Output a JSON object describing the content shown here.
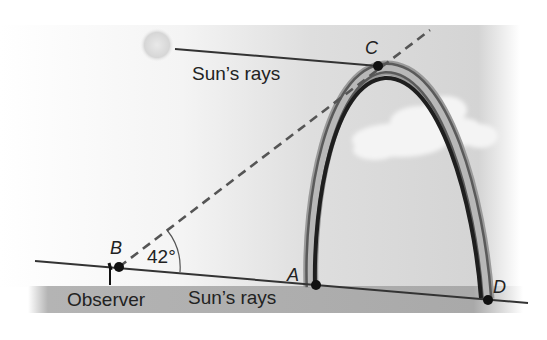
{
  "diagram": {
    "type": "rainbow-geometry",
    "labels": {
      "top_ray": "Sun’s rays",
      "bottom_ray": "Sun’s rays",
      "observer": "Observer",
      "angle": "42°"
    },
    "points": {
      "A": "A",
      "B": "B",
      "C": "C",
      "D": "D"
    },
    "colors": {
      "sky": "#d6d6d6",
      "ground": "#a8a8a8",
      "line": "#333333",
      "dashed": "#555555",
      "rainbow_dark": "#1e1e1e",
      "rainbow_mid": "#7a7a7a",
      "cloud": "#f2f2f2",
      "sun": "#d9d9d9"
    }
  }
}
